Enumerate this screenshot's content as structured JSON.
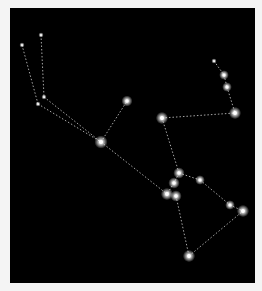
{
  "image": {
    "subject": "Orion constellation star chart",
    "background_color": "#000000",
    "frame_color": "#f4f4f4",
    "line_color": "#cfcfcf",
    "star_color": "#ffffff"
  },
  "stars": [
    {
      "x": 22,
      "y": 45,
      "r": 1.2
    },
    {
      "x": 41,
      "y": 35,
      "r": 1.2
    },
    {
      "x": 44,
      "y": 97,
      "r": 1.2
    },
    {
      "x": 38,
      "y": 104,
      "r": 1.2
    },
    {
      "x": 101,
      "y": 142,
      "r": 3
    },
    {
      "x": 127,
      "y": 101,
      "r": 2.5
    },
    {
      "x": 162,
      "y": 118,
      "r": 2.8
    },
    {
      "x": 214,
      "y": 61,
      "r": 1.2
    },
    {
      "x": 224,
      "y": 75,
      "r": 2.2
    },
    {
      "x": 227,
      "y": 87,
      "r": 2.2
    },
    {
      "x": 235,
      "y": 113,
      "r": 2.8
    },
    {
      "x": 179,
      "y": 173,
      "r": 2.6
    },
    {
      "x": 174,
      "y": 183,
      "r": 2.6
    },
    {
      "x": 200,
      "y": 180,
      "r": 2.2
    },
    {
      "x": 167,
      "y": 194,
      "r": 2.8
    },
    {
      "x": 176,
      "y": 196,
      "r": 2.6
    },
    {
      "x": 230,
      "y": 205,
      "r": 2.2
    },
    {
      "x": 243,
      "y": 211,
      "r": 2.8
    },
    {
      "x": 189,
      "y": 256,
      "r": 2.8
    }
  ],
  "lines": [
    [
      22,
      45,
      38,
      104
    ],
    [
      38,
      104,
      101,
      142
    ],
    [
      41,
      35,
      44,
      97
    ],
    [
      44,
      97,
      101,
      142
    ],
    [
      101,
      142,
      127,
      101
    ],
    [
      101,
      142,
      167,
      194
    ],
    [
      162,
      118,
      179,
      173
    ],
    [
      162,
      118,
      235,
      113
    ],
    [
      214,
      61,
      224,
      75
    ],
    [
      224,
      75,
      227,
      87
    ],
    [
      227,
      87,
      235,
      113
    ],
    [
      179,
      173,
      174,
      183
    ],
    [
      174,
      183,
      167,
      194
    ],
    [
      179,
      173,
      200,
      180
    ],
    [
      200,
      180,
      230,
      205
    ],
    [
      230,
      205,
      243,
      211
    ],
    [
      176,
      196,
      189,
      256
    ],
    [
      189,
      256,
      243,
      211
    ]
  ]
}
